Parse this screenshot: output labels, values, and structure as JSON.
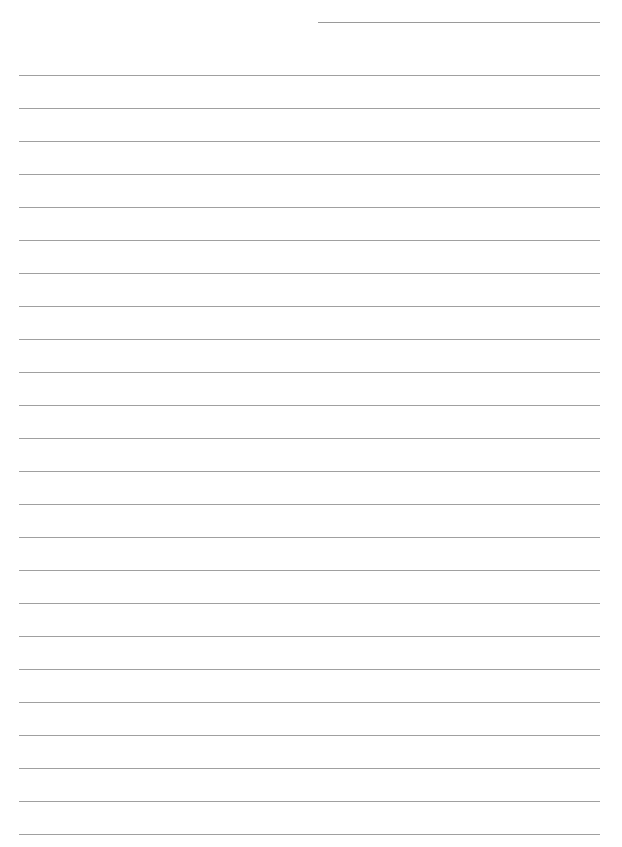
{
  "page": {
    "type": "lined-paper",
    "header_line": {
      "left": 318,
      "top": 22,
      "width": 282
    },
    "rules": {
      "count": 24,
      "first_top": 75,
      "spacing": 33,
      "left": 19,
      "width": 581
    },
    "colors": {
      "background": "#ffffff",
      "line": "#a0a0a0"
    }
  }
}
